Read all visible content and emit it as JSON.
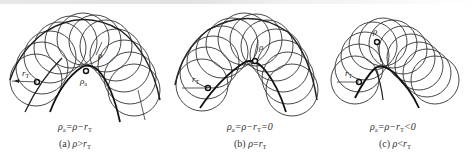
{
  "figure": {
    "panels": [
      {
        "id": "a",
        "formula": {
          "lhs": "ρ",
          "lhs_sub": "a",
          "eq": "=",
          "rhs1": "ρ",
          "minus": "−",
          "rhs2": "r",
          "rhs2_sub": "T",
          "tail": ""
        },
        "caption": {
          "label": "(a)",
          "var1": "ρ",
          "op": ">",
          "var2": "r",
          "var2_sub": "T"
        },
        "labels": {
          "tool_radius": "r",
          "tool_radius_sub": "T",
          "rho": "ρ",
          "rho_a": "ρ",
          "rho_a_sub": "a"
        }
      },
      {
        "id": "b",
        "formula": {
          "lhs": "ρ",
          "lhs_sub": "a",
          "eq": "=",
          "rhs1": "ρ",
          "minus": "−",
          "rhs2": "r",
          "rhs2_sub": "T",
          "tail": "=0"
        },
        "caption": {
          "label": "(b)",
          "var1": "ρ",
          "op": "=",
          "var2": "r",
          "var2_sub": "T"
        },
        "labels": {
          "tool_radius": "r",
          "tool_radius_sub": "T",
          "rho": "ρ"
        }
      },
      {
        "id": "c",
        "formula": {
          "lhs": "ρ",
          "lhs_sub": "a",
          "eq": "=",
          "rhs1": "ρ",
          "minus": "−",
          "rhs2": "r",
          "rhs2_sub": "T",
          "tail": "<0"
        },
        "caption": {
          "label": "(c)",
          "var1": "ρ",
          "op": "<",
          "var2": "r",
          "var2_sub": "T"
        },
        "labels": {
          "tool_radius": "r",
          "tool_radius_sub": "T",
          "rho": "ρ"
        }
      }
    ]
  }
}
